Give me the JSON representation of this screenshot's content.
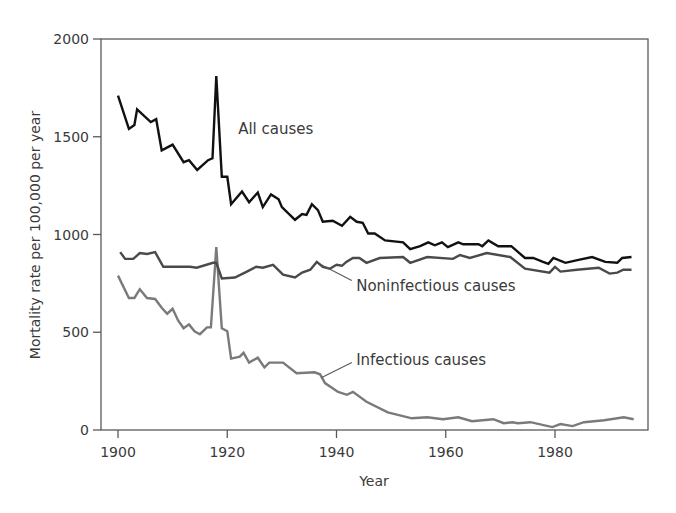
{
  "chart_data": {
    "type": "line",
    "title": "",
    "xlabel": "Year",
    "ylabel": "Mortality rate per 100,000 per year",
    "xlim": [
      1896.9,
      1997
    ],
    "ylim": [
      0,
      2000
    ],
    "x_ticks": [
      1900,
      1920,
      1940,
      1960,
      1980
    ],
    "y_ticks": [
      0,
      500,
      1000,
      1500,
      2000
    ],
    "grid": false,
    "legend": "inline labels",
    "series": [
      {
        "name": "All causes",
        "color": "#111111",
        "width": 2.4,
        "label_pos": [
          1922,
          1540
        ],
        "leader": null,
        "points": [
          [
            1900,
            1710
          ],
          [
            1902,
            1540
          ],
          [
            1903,
            1560
          ],
          [
            1903.5,
            1640
          ],
          [
            1906,
            1575
          ],
          [
            1907,
            1590
          ],
          [
            1908,
            1430
          ],
          [
            1910,
            1460
          ],
          [
            1912,
            1370
          ],
          [
            1913,
            1380
          ],
          [
            1914.5,
            1330
          ],
          [
            1916.5,
            1380
          ],
          [
            1917.3,
            1390
          ],
          [
            1918,
            1810
          ],
          [
            1919,
            1295
          ],
          [
            1920,
            1295
          ],
          [
            1920.7,
            1155
          ],
          [
            1922.7,
            1220
          ],
          [
            1924,
            1165
          ],
          [
            1925.6,
            1215
          ],
          [
            1926.5,
            1140
          ],
          [
            1928,
            1205
          ],
          [
            1929.4,
            1180
          ],
          [
            1930,
            1140
          ],
          [
            1932.4,
            1075
          ],
          [
            1933.7,
            1105
          ],
          [
            1934.5,
            1100
          ],
          [
            1935.5,
            1155
          ],
          [
            1936.6,
            1125
          ],
          [
            1937.5,
            1065
          ],
          [
            1939.3,
            1070
          ],
          [
            1941,
            1045
          ],
          [
            1942.5,
            1090
          ],
          [
            1943.7,
            1065
          ],
          [
            1944.8,
            1060
          ],
          [
            1945.8,
            1005
          ],
          [
            1947,
            1005
          ],
          [
            1948.9,
            970
          ],
          [
            1952.2,
            960
          ],
          [
            1953.5,
            925
          ],
          [
            1955.3,
            940
          ],
          [
            1956.8,
            960
          ],
          [
            1958,
            945
          ],
          [
            1959.3,
            960
          ],
          [
            1960.4,
            935
          ],
          [
            1962.3,
            960
          ],
          [
            1963.2,
            950
          ],
          [
            1966,
            950
          ],
          [
            1966.7,
            940
          ],
          [
            1967.8,
            970
          ],
          [
            1969.6,
            940
          ],
          [
            1972,
            940
          ],
          [
            1974.5,
            880
          ],
          [
            1976,
            880
          ],
          [
            1977.8,
            860
          ],
          [
            1978.8,
            850
          ],
          [
            1979.7,
            880
          ],
          [
            1981.9,
            855
          ],
          [
            1984.3,
            870
          ],
          [
            1986.8,
            885
          ],
          [
            1989.2,
            860
          ],
          [
            1991.4,
            855
          ],
          [
            1992.3,
            880
          ],
          [
            1994,
            885
          ]
        ]
      },
      {
        "name": "Noninfectious causes",
        "color": "#4a4a4a",
        "width": 2.4,
        "label_pos": [
          1943.6,
          735
        ],
        "leader": [
          [
            1937.2,
            845
          ],
          [
            1942.8,
            765
          ]
        ],
        "points": [
          [
            1900.4,
            910
          ],
          [
            1901.3,
            875
          ],
          [
            1902.8,
            875
          ],
          [
            1904,
            905
          ],
          [
            1905.3,
            900
          ],
          [
            1906.8,
            910
          ],
          [
            1908.3,
            835
          ],
          [
            1913.2,
            835
          ],
          [
            1914.4,
            830
          ],
          [
            1917.4,
            855
          ],
          [
            1918,
            855
          ],
          [
            1919,
            775
          ],
          [
            1921.4,
            780
          ],
          [
            1923.6,
            810
          ],
          [
            1925.3,
            835
          ],
          [
            1926.5,
            830
          ],
          [
            1928.4,
            845
          ],
          [
            1930.2,
            795
          ],
          [
            1932.4,
            780
          ],
          [
            1933.7,
            805
          ],
          [
            1935.2,
            820
          ],
          [
            1936.4,
            860
          ],
          [
            1937.5,
            835
          ],
          [
            1938.8,
            825
          ],
          [
            1940,
            845
          ],
          [
            1941,
            840
          ],
          [
            1941.8,
            860
          ],
          [
            1943,
            880
          ],
          [
            1944.2,
            880
          ],
          [
            1945.5,
            855
          ],
          [
            1947.9,
            880
          ],
          [
            1952.2,
            885
          ],
          [
            1953.5,
            855
          ],
          [
            1956.6,
            885
          ],
          [
            1961.3,
            875
          ],
          [
            1962.6,
            895
          ],
          [
            1964.4,
            880
          ],
          [
            1967.5,
            905
          ],
          [
            1971.8,
            885
          ],
          [
            1974.5,
            825
          ],
          [
            1979,
            805
          ],
          [
            1980,
            835
          ],
          [
            1981,
            810
          ],
          [
            1984,
            820
          ],
          [
            1988,
            830
          ],
          [
            1990,
            800
          ],
          [
            1991.4,
            805
          ],
          [
            1992.5,
            820
          ],
          [
            1994,
            820
          ]
        ]
      },
      {
        "name": "Infectious causes",
        "color": "#7a7a7a",
        "width": 2.4,
        "label_pos": [
          1943.6,
          360
        ],
        "leader": [
          [
            1937.3,
            268
          ],
          [
            1942.8,
            345
          ]
        ],
        "points": [
          [
            1900,
            790
          ],
          [
            1902,
            675
          ],
          [
            1903,
            675
          ],
          [
            1904,
            720
          ],
          [
            1905.3,
            675
          ],
          [
            1906.8,
            670
          ],
          [
            1908,
            625
          ],
          [
            1909,
            595
          ],
          [
            1910,
            620
          ],
          [
            1911,
            560
          ],
          [
            1912,
            520
          ],
          [
            1913,
            540
          ],
          [
            1914,
            505
          ],
          [
            1915,
            490
          ],
          [
            1916.3,
            525
          ],
          [
            1917,
            525
          ],
          [
            1918,
            935
          ],
          [
            1919,
            520
          ],
          [
            1920,
            505
          ],
          [
            1920.7,
            365
          ],
          [
            1922.3,
            375
          ],
          [
            1923,
            395
          ],
          [
            1924,
            345
          ],
          [
            1925.6,
            370
          ],
          [
            1926.8,
            320
          ],
          [
            1927.7,
            345
          ],
          [
            1930.2,
            345
          ],
          [
            1932.7,
            290
          ],
          [
            1936,
            295
          ],
          [
            1937,
            285
          ],
          [
            1937.9,
            240
          ],
          [
            1940.3,
            195
          ],
          [
            1941.9,
            180
          ],
          [
            1943,
            195
          ],
          [
            1945.5,
            145
          ],
          [
            1949.4,
            90
          ],
          [
            1953.8,
            60
          ],
          [
            1956.6,
            65
          ],
          [
            1959.5,
            55
          ],
          [
            1962.3,
            65
          ],
          [
            1964.8,
            45
          ],
          [
            1968.7,
            55
          ],
          [
            1970.6,
            35
          ],
          [
            1972.2,
            40
          ],
          [
            1973.2,
            35
          ],
          [
            1975.5,
            40
          ],
          [
            1979.5,
            15
          ],
          [
            1981,
            30
          ],
          [
            1983.2,
            20
          ],
          [
            1985.3,
            40
          ],
          [
            1989,
            50
          ],
          [
            1992.6,
            65
          ],
          [
            1994.4,
            55
          ]
        ]
      }
    ]
  }
}
